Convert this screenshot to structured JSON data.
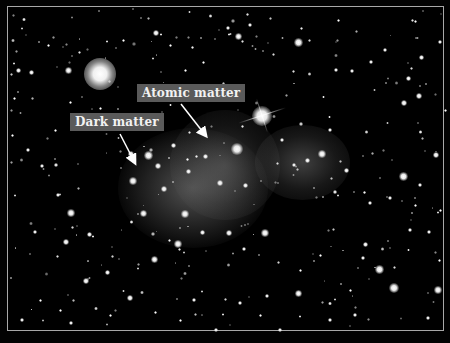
{
  "image": {
    "subject": "galaxy cluster collision with dark matter and atomic matter halos",
    "background_color": "#000000",
    "frame_color": "#a8a8a8"
  },
  "annotations": {
    "atomic_matter": {
      "label": "Atomic matter",
      "box_color": "#5a5a5a",
      "text_color": "#f2f2f2"
    },
    "dark_matter": {
      "label": "Dark matter",
      "box_color": "#5a5a5a",
      "text_color": "#f2f2f2"
    }
  }
}
